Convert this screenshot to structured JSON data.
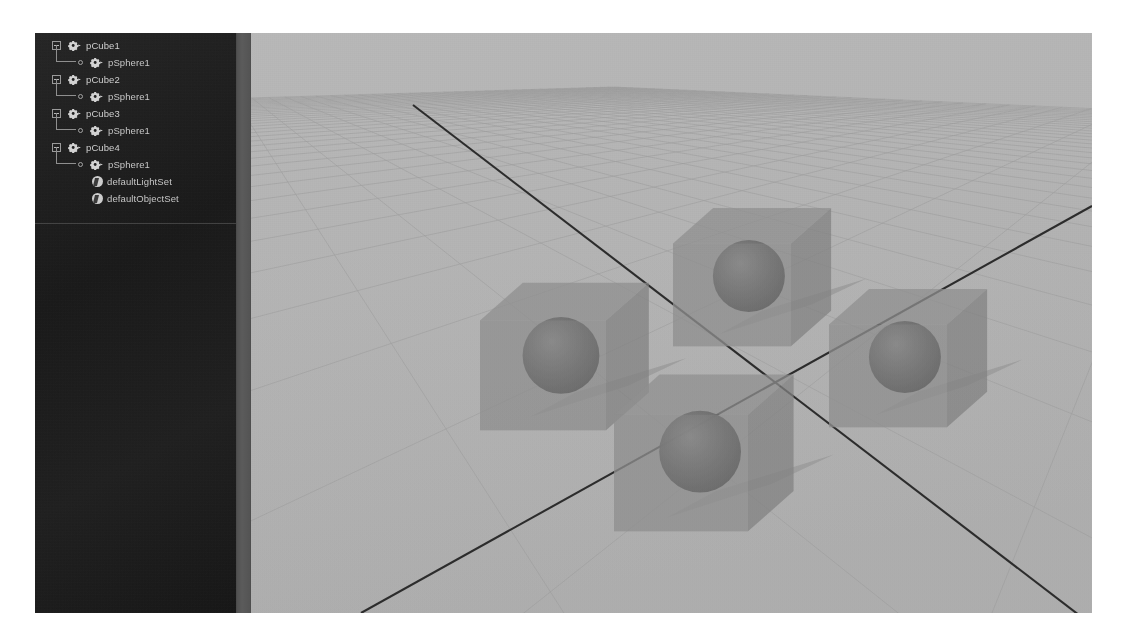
{
  "app": {
    "name": "Maya",
    "panel_title": "Outliner"
  },
  "outliner": {
    "rows": [
      {
        "label": "pCube1",
        "type": "transform",
        "depth": 0,
        "icon": "shape-node-icon",
        "expanded": true
      },
      {
        "label": "pSphere1",
        "type": "transform",
        "depth": 1,
        "icon": "shape-node-icon",
        "expanded": null
      },
      {
        "label": "pCube2",
        "type": "transform",
        "depth": 0,
        "icon": "shape-node-icon",
        "expanded": true
      },
      {
        "label": "pSphere1",
        "type": "transform",
        "depth": 1,
        "icon": "shape-node-icon",
        "expanded": null
      },
      {
        "label": "pCube3",
        "type": "transform",
        "depth": 0,
        "icon": "shape-node-icon",
        "expanded": true
      },
      {
        "label": "pSphere1",
        "type": "transform",
        "depth": 1,
        "icon": "shape-node-icon",
        "expanded": null
      },
      {
        "label": "pCube4",
        "type": "transform",
        "depth": 0,
        "icon": "shape-node-icon",
        "expanded": true
      },
      {
        "label": "pSphere1",
        "type": "transform",
        "depth": 1,
        "icon": "shape-node-icon",
        "expanded": null
      },
      {
        "label": "defaultLightSet",
        "type": "set",
        "depth": 1,
        "icon": "set-node-icon",
        "expanded": null
      },
      {
        "label": "defaultObjectSet",
        "type": "set",
        "depth": 1,
        "icon": "set-node-icon",
        "expanded": null
      }
    ]
  },
  "viewport": {
    "label": "perspective-viewport",
    "background_color": "#b4b4b4",
    "grid_color": "#9a9a9a",
    "axis_color": "#2b2b2b",
    "object_fill": "#8d8d8d",
    "sphere_fill": "#6f6f6f",
    "shadow_color": "#9d9d9d",
    "object_count": 4,
    "objects": [
      {
        "name": "pCube1",
        "child": "pSphere1",
        "cx": 292,
        "cy": 333,
        "size": 126
      },
      {
        "name": "pCube2",
        "child": "pSphere1",
        "cx": 481,
        "cy": 253,
        "size": 118
      },
      {
        "name": "pCube3",
        "child": "pSphere1",
        "cx": 430,
        "cy": 430,
        "size": 134
      },
      {
        "name": "pCube4",
        "child": "pSphere1",
        "cx": 637,
        "cy": 334,
        "size": 118
      }
    ]
  },
  "colors": {
    "panel_bg": "#1b1b1b",
    "panel_text": "#cfcfcf",
    "scrollbar": "#525252",
    "page_bg": "#ffffff"
  }
}
